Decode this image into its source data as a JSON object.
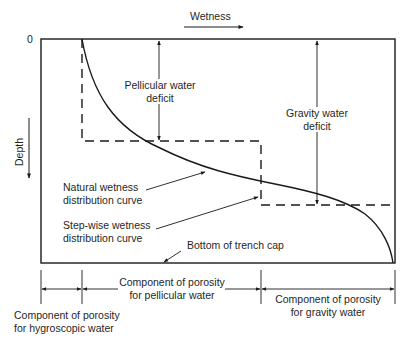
{
  "diagram": {
    "axes": {
      "x_label": "Wetness",
      "y_label": "Depth",
      "origin_label": "0"
    },
    "curves": {
      "natural": {
        "label_line1": "Natural wetness",
        "label_line2": "distribution curve"
      },
      "stepwise": {
        "label_line1": "Step-wise wetness",
        "label_line2": "distribution curve"
      }
    },
    "deficits": {
      "pellicular": {
        "line1": "Pellicular water",
        "line2": "deficit"
      },
      "gravity": {
        "line1": "Gravity water",
        "line2": "deficit"
      }
    },
    "bottom_label": "Bottom of trench cap",
    "porosity_components": {
      "hygroscopic": {
        "line1": "Component of porosity",
        "line2": "for hygroscopic water"
      },
      "pellicular": {
        "line1": "Component of porosity",
        "line2": "for pellicular water"
      },
      "gravity": {
        "line1": "Component of porosity",
        "line2": "for gravity water"
      }
    },
    "colors": {
      "line": "#1a1a1a",
      "background": "#ffffff"
    }
  }
}
